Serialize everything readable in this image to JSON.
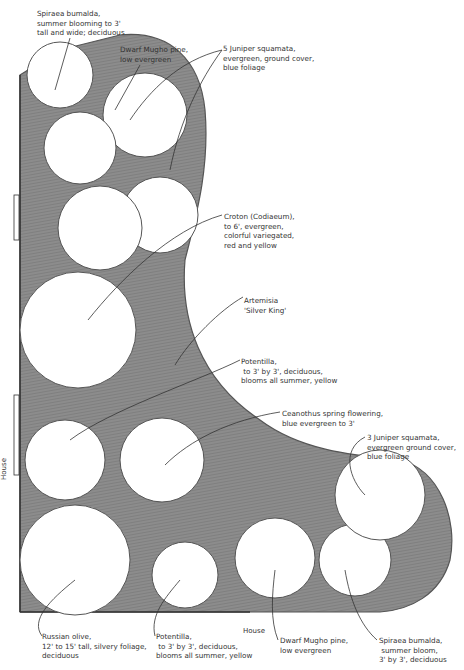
{
  "house_labels": {
    "vertical": "House",
    "horizontal": "House"
  },
  "colors": {
    "bed_fill": "#8a8a8a",
    "bed_dark": "#6f6f6f",
    "plant_fill": "#ffffff",
    "line": "#333333"
  },
  "labels": [
    {
      "id": "spiraea-top",
      "text": "Spiraea bumalda,\nsummer blooming to 3'\ntall and wide; deciduous",
      "x": 37,
      "y": 9
    },
    {
      "id": "mugho-top",
      "text": "Dwarf Mugho pine,\nlow evergreen",
      "x": 120,
      "y": 45
    },
    {
      "id": "juniper-top",
      "text": "5 Juniper squamata,\nevergreen, ground cover,\nblue foliage",
      "x": 223,
      "y": 44
    },
    {
      "id": "croton",
      "text": "Croton (Codiaeum),\nto 6', evergreen,\ncolorful variegated,\nred and yellow",
      "x": 224,
      "y": 212
    },
    {
      "id": "artemisia",
      "text": "Artemisia\n'Silver King'",
      "x": 244,
      "y": 296
    },
    {
      "id": "potentilla-mid",
      "text": "Potentilla,\n to 3' by 3', deciduous,\nblooms all summer, yellow",
      "x": 241,
      "y": 357
    },
    {
      "id": "ceanothus",
      "text": "Ceanothus spring flowering,\nblue evergreen to 3'",
      "x": 282,
      "y": 409
    },
    {
      "id": "juniper-right",
      "text": "3 Juniper squamata,\nevergreen ground cover,\nblue foliage",
      "x": 367,
      "y": 433
    },
    {
      "id": "russian-olive",
      "text": "Russian olive,\n12' to 15' tall, silvery foliage,\ndeciduous",
      "x": 42,
      "y": 632
    },
    {
      "id": "potentilla-bottom",
      "text": "Potentilla,\n to 3' by 3', deciduous,\nblooms all summer, yellow",
      "x": 156,
      "y": 632
    },
    {
      "id": "mugho-bottom",
      "text": "Dwarf Mugho pine,\nlow evergreen",
      "x": 280,
      "y": 636
    },
    {
      "id": "spiraea-bottom",
      "text": "Spiraea bumalda,\n summer bloom,\n3' by 3', deciduous",
      "x": 379,
      "y": 636
    }
  ],
  "plants": [
    {
      "name": "spiraea-top",
      "cx": 60,
      "cy": 75,
      "r": 33
    },
    {
      "name": "mugho-top",
      "cx": 80,
      "cy": 148,
      "r": 36
    },
    {
      "name": "juniper-cluster-top",
      "cx": 145,
      "cy": 115,
      "r": 42
    },
    {
      "name": "croton",
      "cx": 100,
      "cy": 228,
      "r": 42
    },
    {
      "name": "juniper-tall",
      "cx": 160,
      "cy": 215,
      "r": 38
    },
    {
      "name": "artemisia",
      "cx": 78,
      "cy": 330,
      "r": 58
    },
    {
      "name": "potentilla-mid",
      "cx": 65,
      "cy": 460,
      "r": 40
    },
    {
      "name": "ceanothus",
      "cx": 162,
      "cy": 460,
      "r": 42
    },
    {
      "name": "russian-olive",
      "cx": 75,
      "cy": 560,
      "r": 55
    },
    {
      "name": "potentilla-bottom",
      "cx": 185,
      "cy": 575,
      "r": 33
    },
    {
      "name": "mugho-bottom",
      "cx": 275,
      "cy": 558,
      "r": 40
    },
    {
      "name": "spiraea-bottom",
      "cx": 355,
      "cy": 560,
      "r": 36
    },
    {
      "name": "juniper-right",
      "cx": 380,
      "cy": 495,
      "r": 45
    }
  ]
}
